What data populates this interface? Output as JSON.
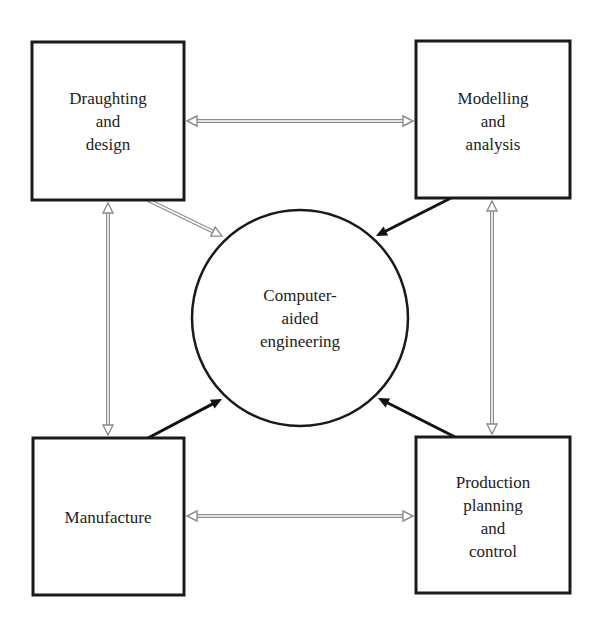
{
  "diagram": {
    "center": {
      "id": "cae",
      "lines": [
        "Computer-",
        "aided",
        "engineering"
      ]
    },
    "nodes": [
      {
        "id": "draughting",
        "lines": [
          "Draughting",
          "and",
          "design"
        ]
      },
      {
        "id": "modelling",
        "lines": [
          "Modelling",
          "and",
          "analysis"
        ]
      },
      {
        "id": "manufacture",
        "lines": [
          "Manufacture"
        ]
      },
      {
        "id": "production",
        "lines": [
          "Production",
          "planning",
          "and",
          "control"
        ]
      }
    ],
    "connections": [
      {
        "from": "draughting",
        "to": "modelling",
        "style": "hollow",
        "direction": "both"
      },
      {
        "from": "manufacture",
        "to": "production",
        "style": "hollow",
        "direction": "both"
      },
      {
        "from": "draughting",
        "to": "manufacture",
        "style": "hollow",
        "direction": "both"
      },
      {
        "from": "modelling",
        "to": "production",
        "style": "hollow",
        "direction": "both"
      },
      {
        "from": "draughting",
        "to": "cae",
        "style": "hollow",
        "direction": "forward"
      },
      {
        "from": "modelling",
        "to": "cae",
        "style": "solid",
        "direction": "forward"
      },
      {
        "from": "manufacture",
        "to": "cae",
        "style": "solid",
        "direction": "forward"
      },
      {
        "from": "production",
        "to": "cae",
        "style": "solid",
        "direction": "forward"
      }
    ],
    "colors": {
      "stroke": "#1a1a1a",
      "hollow_arrow": "#8c8c8c",
      "solid_arrow": "#111111",
      "text": "#222222"
    }
  }
}
